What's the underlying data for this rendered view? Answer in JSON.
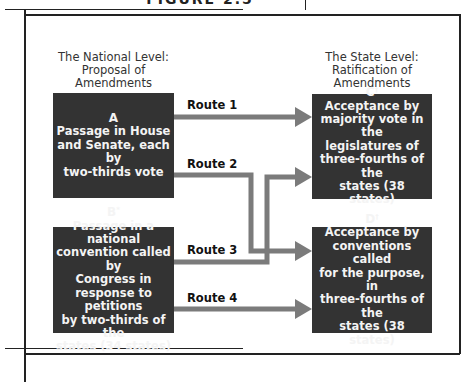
{
  "figure": {
    "title": "FIGURE 2.5"
  },
  "headers": {
    "national": {
      "line1": "The National Level:",
      "line2": "Proposal of",
      "line3": "Amendments"
    },
    "state": {
      "line1": "The State Level:",
      "line2": "Ratification of",
      "line3": "Amendments"
    }
  },
  "boxes": {
    "A": {
      "letter": "A",
      "mark": "",
      "lines": [
        "Passage in House",
        "and Senate, each by",
        "two-thirds vote"
      ]
    },
    "B": {
      "letter": "B",
      "mark": "*",
      "lines": [
        "Passage in a national",
        "convention called by",
        "Congress in",
        "response to petitions",
        "by two-thirds of the",
        "states (34 states)"
      ]
    },
    "C": {
      "letter": "C",
      "mark": "†",
      "lines": [
        "Acceptance by",
        "majority vote in the",
        "legislatures of",
        "three-fourths of the",
        "states (38 states)"
      ]
    },
    "D": {
      "letter": "D",
      "mark": "†",
      "lines": [
        "Acceptance by",
        "conventions called",
        "for the purpose, in",
        "three-fourths of the",
        "states (38 states)"
      ]
    }
  },
  "routes": [
    {
      "label": "Route 1",
      "from": "A",
      "to": "C"
    },
    {
      "label": "Route 2",
      "from": "A",
      "to": "D"
    },
    {
      "label": "Route 3",
      "from": "B",
      "to": "C"
    },
    {
      "label": "Route 4",
      "from": "B",
      "to": "D"
    }
  ],
  "colors": {
    "box_fill": "#333333",
    "box_text": "#f4f4f4",
    "arrow": "#7b7b7b",
    "frame": "#222222"
  }
}
